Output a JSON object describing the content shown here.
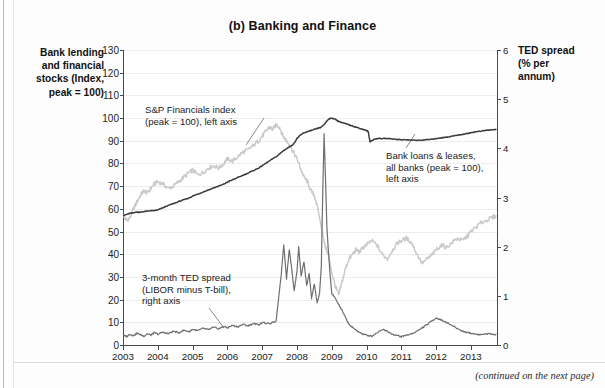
{
  "title": "(b) Banking and Finance",
  "left_axis_caption": "Bank lending\nand financial\nstocks (Index,\npeak = 100)",
  "right_axis_caption": "TED spread\n(% per\nannum)",
  "footer_note": "(continued on the next page)",
  "annotations": {
    "sp": "S&P Financials index\n(peak = 100), left axis",
    "loans": "Bank loans & leases,\nall banks (peak = 100),\nleft axis",
    "ted": "3-month TED spread\n(LIBOR minus T-bill),\nright axis"
  },
  "colors": {
    "sp_financials": "#c9c9c9",
    "bank_loans": "#3a3a3a",
    "ted_spread": "#6e6e6e",
    "axis": "#4a4a4a",
    "grid": "#ececec",
    "background": "#ffffff"
  },
  "chart_data": {
    "type": "line",
    "title": "(b) Banking and Finance",
    "xlabel": "",
    "ylabel": "Bank lending and financial stocks (Index, peak = 100)",
    "y2label": "TED spread (% per annum)",
    "xlim": [
      2003.0,
      2013.75
    ],
    "ylim": [
      0,
      130
    ],
    "y2lim": [
      0,
      6
    ],
    "grid": true,
    "legend": "annotations-inline",
    "xticks": [
      2003,
      2004,
      2005,
      2006,
      2007,
      2008,
      2009,
      2010,
      2011,
      2012,
      2013
    ],
    "yticks_left": [
      0,
      10,
      20,
      30,
      40,
      50,
      60,
      70,
      80,
      90,
      100,
      110,
      120,
      130
    ],
    "yticks_right": [
      0,
      1,
      2,
      3,
      4,
      5,
      6
    ],
    "series": [
      {
        "name": "S&P Financials index (peak = 100), left axis",
        "axis": "left",
        "color": "#c9c9c9",
        "x": [
          2003.0,
          2003.1,
          2003.2,
          2003.3,
          2003.4,
          2003.5,
          2003.6,
          2003.7,
          2003.8,
          2003.9,
          2004.0,
          2004.15,
          2004.3,
          2004.45,
          2004.6,
          2004.75,
          2004.9,
          2005.0,
          2005.15,
          2005.3,
          2005.45,
          2005.6,
          2005.75,
          2005.9,
          2006.0,
          2006.15,
          2006.3,
          2006.45,
          2006.6,
          2006.75,
          2006.9,
          2007.0,
          2007.1,
          2007.2,
          2007.3,
          2007.4,
          2007.5,
          2007.6,
          2007.7,
          2007.8,
          2007.9,
          2008.0,
          2008.1,
          2008.2,
          2008.3,
          2008.4,
          2008.5,
          2008.6,
          2008.7,
          2008.8,
          2008.9,
          2009.0,
          2009.1,
          2009.2,
          2009.3,
          2009.4,
          2009.5,
          2009.6,
          2009.7,
          2009.8,
          2009.9,
          2010.0,
          2010.15,
          2010.3,
          2010.45,
          2010.6,
          2010.75,
          2010.9,
          2011.0,
          2011.15,
          2011.3,
          2011.45,
          2011.6,
          2011.75,
          2011.9,
          2012.0,
          2012.15,
          2012.3,
          2012.45,
          2012.6,
          2012.75,
          2012.9,
          2013.0,
          2013.15,
          2013.3,
          2013.45,
          2013.6,
          2013.72
        ],
        "values": [
          57,
          55,
          56,
          60,
          63,
          66,
          68,
          67,
          69,
          71,
          72,
          71,
          69,
          70,
          72,
          74,
          76,
          77,
          75,
          76,
          78,
          79,
          78,
          80,
          82,
          81,
          83,
          85,
          86,
          88,
          90,
          92,
          94,
          96,
          95,
          97,
          96,
          92,
          90,
          88,
          85,
          82,
          78,
          74,
          72,
          68,
          66,
          60,
          52,
          44,
          40,
          32,
          26,
          22,
          28,
          34,
          38,
          40,
          42,
          41,
          43,
          44,
          46,
          44,
          40,
          38,
          42,
          45,
          46,
          47,
          45,
          40,
          36,
          38,
          40,
          42,
          44,
          43,
          45,
          47,
          46,
          48,
          50,
          52,
          54,
          55,
          56,
          57
        ],
        "annotation": "S&P Financials index (peak = 100), left axis"
      },
      {
        "name": "Bank loans & leases, all banks (peak = 100), left axis",
        "axis": "left",
        "color": "#3a3a3a",
        "x": [
          2003.0,
          2003.1,
          2003.2,
          2003.3,
          2003.4,
          2003.5,
          2003.6,
          2003.7,
          2003.8,
          2003.9,
          2004.0,
          2004.15,
          2004.3,
          2004.45,
          2004.6,
          2004.75,
          2004.9,
          2005.0,
          2005.15,
          2005.3,
          2005.45,
          2005.6,
          2005.75,
          2005.9,
          2006.0,
          2006.15,
          2006.3,
          2006.45,
          2006.6,
          2006.75,
          2006.9,
          2007.0,
          2007.15,
          2007.3,
          2007.45,
          2007.6,
          2007.75,
          2007.9,
          2008.0,
          2008.1,
          2008.2,
          2008.3,
          2008.4,
          2008.5,
          2008.6,
          2008.7,
          2008.8,
          2008.9,
          2009.0,
          2009.1,
          2009.2,
          2009.3,
          2009.4,
          2009.5,
          2009.6,
          2009.7,
          2009.8,
          2009.9,
          2010.0,
          2010.05,
          2010.1,
          2010.2,
          2010.3,
          2010.45,
          2010.6,
          2010.75,
          2010.9,
          2011.0,
          2011.15,
          2011.3,
          2011.45,
          2011.6,
          2011.75,
          2011.9,
          2012.0,
          2012.15,
          2012.3,
          2012.45,
          2012.6,
          2012.75,
          2012.9,
          2013.0,
          2013.15,
          2013.3,
          2013.45,
          2013.6,
          2013.72
        ],
        "values": [
          57,
          57.5,
          58,
          58.3,
          58.6,
          58.5,
          58.8,
          59,
          59.2,
          59.2,
          59.5,
          60.5,
          61.5,
          62.3,
          63.2,
          64,
          64.8,
          65.6,
          66.5,
          67.4,
          68.3,
          69.2,
          70,
          70.9,
          71.8,
          72.8,
          73.8,
          74.8,
          75.8,
          76.9,
          78,
          79,
          80.5,
          82,
          83.5,
          85.5,
          87,
          88.5,
          91,
          92.5,
          93.5,
          94,
          94.5,
          95,
          95.5,
          96,
          97.5,
          99.5,
          100,
          99.5,
          98.5,
          98,
          97.5,
          97,
          96.5,
          96,
          95.5,
          95,
          94.5,
          94,
          89.5,
          90.5,
          91,
          91,
          91,
          90.8,
          90.6,
          90.5,
          90.4,
          90.3,
          90.2,
          90.3,
          90.5,
          90.7,
          91,
          91.3,
          91.6,
          92,
          92.4,
          92.8,
          93.2,
          93.6,
          94,
          94.3,
          94.6,
          94.8,
          95
        ],
        "annotation": "Bank loans & leases, all banks (peak = 100), left axis",
        "note": "structural break (series discontinuity) at early 2010"
      },
      {
        "name": "3-month TED spread (LIBOR minus T-bill), right axis",
        "axis": "right",
        "color": "#6e6e6e",
        "units": "percent per annum",
        "x": [
          2003.0,
          2003.1,
          2003.2,
          2003.3,
          2003.4,
          2003.5,
          2003.6,
          2003.7,
          2003.8,
          2003.9,
          2004.0,
          2004.15,
          2004.3,
          2004.45,
          2004.6,
          2004.75,
          2004.9,
          2005.0,
          2005.15,
          2005.3,
          2005.45,
          2005.6,
          2005.75,
          2005.9,
          2006.0,
          2006.15,
          2006.3,
          2006.45,
          2006.6,
          2006.75,
          2006.9,
          2007.0,
          2007.2,
          2007.4,
          2007.55,
          2007.62,
          2007.7,
          2007.78,
          2007.85,
          2007.92,
          2008.0,
          2008.05,
          2008.12,
          2008.2,
          2008.28,
          2008.35,
          2008.42,
          2008.5,
          2008.58,
          2008.65,
          2008.7,
          2008.74,
          2008.78,
          2008.82,
          2008.86,
          2008.9,
          2008.95,
          2009.0,
          2009.1,
          2009.2,
          2009.3,
          2009.4,
          2009.5,
          2009.6,
          2009.75,
          2009.9,
          2010.0,
          2010.15,
          2010.3,
          2010.45,
          2010.6,
          2010.75,
          2010.9,
          2011.0,
          2011.15,
          2011.3,
          2011.45,
          2011.6,
          2011.75,
          2011.9,
          2012.0,
          2012.1,
          2012.25,
          2012.4,
          2012.55,
          2012.7,
          2012.85,
          2013.0,
          2013.15,
          2013.3,
          2013.45,
          2013.6,
          2013.72
        ],
        "values": [
          0.2,
          0.17,
          0.22,
          0.19,
          0.24,
          0.21,
          0.18,
          0.23,
          0.2,
          0.25,
          0.22,
          0.26,
          0.23,
          0.28,
          0.25,
          0.3,
          0.27,
          0.32,
          0.29,
          0.34,
          0.31,
          0.36,
          0.33,
          0.38,
          0.35,
          0.4,
          0.37,
          0.42,
          0.39,
          0.44,
          0.41,
          0.46,
          0.43,
          0.48,
          1.45,
          2.05,
          1.35,
          1.95,
          1.55,
          1.1,
          1.5,
          2.0,
          1.4,
          1.7,
          1.2,
          1.45,
          0.95,
          1.25,
          0.85,
          1.05,
          1.6,
          3.05,
          4.3,
          3.4,
          2.4,
          1.95,
          1.45,
          1.05,
          0.95,
          0.82,
          0.7,
          0.55,
          0.42,
          0.35,
          0.28,
          0.22,
          0.2,
          0.18,
          0.25,
          0.32,
          0.28,
          0.22,
          0.19,
          0.17,
          0.2,
          0.23,
          0.28,
          0.35,
          0.42,
          0.5,
          0.55,
          0.52,
          0.48,
          0.42,
          0.36,
          0.3,
          0.26,
          0.24,
          0.22,
          0.21,
          0.23,
          0.22,
          0.22
        ],
        "annotation": "3-month TED spread (LIBOR minus T-bill), right axis",
        "peak_value": 4.3,
        "peak_date": "2008 (late)"
      }
    ]
  }
}
